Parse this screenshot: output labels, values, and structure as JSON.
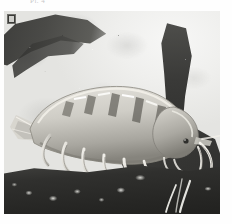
{
  "artwork": {
    "title": "Shrimp among rocks and waterside foliage",
    "medium": "watercolour and gouache, monochrome",
    "caption_text": "Pl. 4",
    "palette": {
      "paper": "#fefefe",
      "plate_base": "#e9e9e7",
      "sky_light": "#f7f7f6",
      "branch_dark": "#3b3b39",
      "rock_dark": "#262624",
      "shrimp_body": "#cfcdc6",
      "shrimp_shadow": "#8e8c85",
      "highlight": "#ffffff",
      "seal_dark": "#3a3a37"
    }
  },
  "plate": {
    "left": 4,
    "top": 11,
    "width": 216,
    "height": 203
  },
  "subject": {
    "name": "shrimp",
    "body_label": "segmented carapace and abdomen",
    "eye_label": "compound eye",
    "antennae_label": "long paired antennae",
    "legs_label": "walking legs and pleopods",
    "tail_label": "tail fan"
  },
  "background": {
    "branch_upper_left": "dark diagonal branch",
    "branch_right": "dark vertical branch",
    "foliage": "mottled light and dark foliage clumps",
    "rock_foreground": "dark foreground rock slab with pale pebbles"
  },
  "marks": {
    "seal_label": "artist seal"
  }
}
